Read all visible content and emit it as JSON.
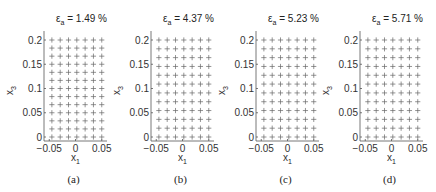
{
  "chart_data": [
    {
      "type": "scatter",
      "panel": "(a)",
      "title": "ε_a = 1.49 %",
      "title_symbol": "ε",
      "title_sub": "a",
      "title_value": "= 1.49 %",
      "xlabel": "x_1",
      "ylabel": "x_3",
      "xticks": [
        "-0.05",
        "0",
        "0.05"
      ],
      "yticks": [
        "0",
        "0.05",
        "0.1",
        "0.15",
        "0.2"
      ],
      "xlim": [
        -0.06,
        0.06
      ],
      "ylim": [
        -0.005,
        0.21
      ],
      "marker": "+",
      "grid_cols": 7,
      "grid_rows": 13,
      "x_range": [
        -0.045,
        0.05
      ],
      "y_range": [
        0.0,
        0.2
      ]
    },
    {
      "type": "scatter",
      "panel": "(b)",
      "title": "ε_a = 4.37 %",
      "title_symbol": "ε",
      "title_sub": "a",
      "title_value": "= 4.37 %",
      "xlabel": "x_1",
      "ylabel": "x_3",
      "xticks": [
        "-0.05",
        "0",
        "0.05"
      ],
      "yticks": [
        "0",
        "0.05",
        "0.1",
        "0.15",
        "0.2"
      ],
      "xlim": [
        -0.06,
        0.06
      ],
      "ylim": [
        -0.005,
        0.21
      ],
      "marker": "+",
      "grid_cols": 7,
      "grid_rows": 12,
      "x_range": [
        -0.045,
        0.05
      ],
      "y_range": [
        0.0,
        0.2
      ]
    },
    {
      "type": "scatter",
      "panel": "(c)",
      "title": "ε_a = 5.23 %",
      "title_symbol": "ε",
      "title_sub": "a",
      "title_value": "= 5.23 %",
      "xlabel": "x_1",
      "ylabel": "x_3",
      "xticks": [
        "-0.05",
        "0",
        "0.05"
      ],
      "yticks": [
        "0",
        "0.05",
        "0.1",
        "0.15",
        "0.2"
      ],
      "xlim": [
        -0.06,
        0.06
      ],
      "ylim": [
        -0.005,
        0.21
      ],
      "marker": "+",
      "grid_cols": 7,
      "grid_rows": 12,
      "x_range": [
        -0.045,
        0.05
      ],
      "y_range": [
        0.0,
        0.2
      ]
    },
    {
      "type": "scatter",
      "panel": "(d)",
      "title": "ε_a = 5.71 %",
      "title_symbol": "ε",
      "title_sub": "a",
      "title_value": "= 5.71 %",
      "xlabel": "x_1",
      "ylabel": "x_3",
      "xticks": [
        "-0.05",
        "0",
        "0.05"
      ],
      "yticks": [
        "0",
        "0.05",
        "0.1",
        "0.15",
        "0.2"
      ],
      "xlim": [
        -0.06,
        0.06
      ],
      "ylim": [
        -0.005,
        0.21
      ],
      "marker": "+",
      "grid_cols": 7,
      "grid_rows": 12,
      "x_range": [
        -0.045,
        0.05
      ],
      "y_range": [
        0.0,
        0.2
      ]
    }
  ],
  "layout": {
    "panel_axis_left": [
      44,
      151,
      256,
      360
    ],
    "panel_width": 63,
    "y_top_px": 40,
    "y_zero_px": 137,
    "axis_top_px": 31,
    "axis_bottom_px": 141,
    "colors": {
      "axis": "#555555",
      "marker": "#666666",
      "text": "#222222"
    }
  }
}
